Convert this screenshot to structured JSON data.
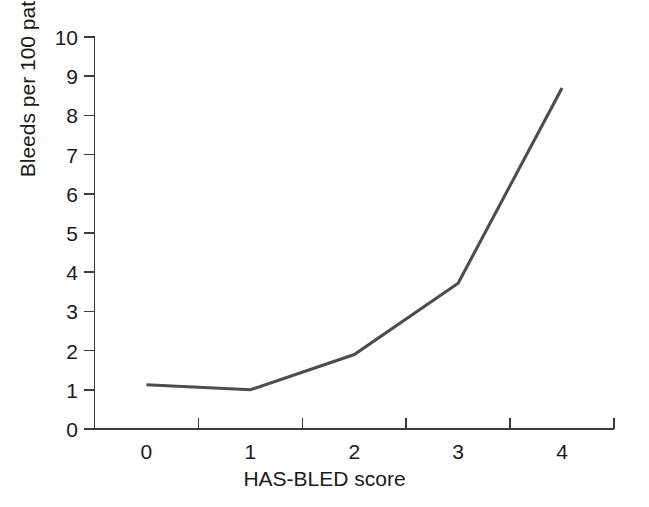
{
  "chart_data": {
    "type": "line",
    "title": "",
    "xlabel": "HAS-BLED score",
    "ylabel": "Bleeds per 100 patient-years",
    "x": [
      0,
      1,
      2,
      3,
      4
    ],
    "categories": [
      "0",
      "1",
      "2",
      "3",
      "4"
    ],
    "values": [
      1.13,
      1.0,
      1.9,
      3.72,
      8.7
    ],
    "series": [
      {
        "name": "Bleeds per 100 patient-years",
        "values": [
          1.13,
          1.0,
          1.9,
          3.72,
          8.7
        ]
      }
    ],
    "xlim": [
      -0.5,
      4.5
    ],
    "ylim": [
      0,
      10
    ],
    "ytick_labels": [
      "10",
      "9",
      "8",
      "7",
      "6",
      "5",
      "4",
      "3",
      "2",
      "1",
      "0"
    ],
    "ytick_values": [
      10,
      9,
      8,
      7,
      6,
      5,
      4,
      3,
      2,
      1,
      0
    ],
    "xtick_labels": [
      "0",
      "1",
      "2",
      "3",
      "4"
    ],
    "grid": false,
    "legend": false,
    "legend_position": "none",
    "markers": false,
    "line_color": "#4d4d4d",
    "axis_color": "#3b3b3b",
    "background_color": "#ffffff"
  }
}
